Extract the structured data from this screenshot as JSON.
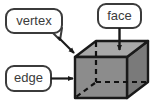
{
  "diagram": {
    "type": "geometry-annotated-solid",
    "solid": "cube",
    "background_color": "#ffffff"
  },
  "colors": {
    "outline": "#1a1a1a",
    "front_face_fill": "#8c8c8c",
    "right_face_fill": "#7a7a7a",
    "top_face_fill": "#a8a8a8",
    "hidden_edge": "#111111",
    "callout_border": "#3b3b3b",
    "callout_fill": "#ffffff",
    "text_color": "#3b3b3b",
    "arrow_color": "#1a1a1a"
  },
  "callouts": [
    {
      "id": "vertex",
      "label": "vertex",
      "position": "top-left",
      "pointer_style": "speech-tail-arrow",
      "points_to": "cube-top-left-corner"
    },
    {
      "id": "face",
      "label": "face",
      "position": "top-right",
      "pointer_style": "straight-arrow",
      "points_to": "cube-top-face"
    },
    {
      "id": "edge",
      "label": "edge",
      "position": "middle-left",
      "pointer_style": "straight-arrow",
      "points_to": "cube-left-vertical-edge"
    }
  ],
  "cube_geometry": {
    "front_face": "75,57 75,98 127,98 127,57",
    "top_face": "75,57 96,41 148,41 127,57",
    "right_face": "127,57 148,41 148,82 127,98",
    "hidden_vertex": "96,82",
    "hidden_edges": [
      "96,41 96,82",
      "96,82 148,82",
      "96,82 75,98"
    ]
  }
}
